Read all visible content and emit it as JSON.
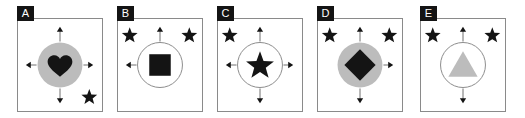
{
  "figure": {
    "type": "panel-series",
    "panel_count": 5,
    "background_color": "#ffffff",
    "frame_color": "#8a8a8a",
    "badge_background": "#141414",
    "badge_text_color": "#ffffff",
    "gray_fill": "#bcbcbc",
    "black_fill": "#141414",
    "arrow_color": "#6e6e6e"
  },
  "panels": [
    {
      "label": "A",
      "circle": {
        "fill": "gray",
        "outline": "none"
      },
      "shape": {
        "name": "heart",
        "fill": "black"
      },
      "arrows": [
        "up",
        "right",
        "down",
        "left"
      ],
      "arrow_count": 4,
      "stars": [
        "bottom-right"
      ],
      "star_count": 1
    },
    {
      "label": "B",
      "circle": {
        "fill": "white",
        "outline": "gray"
      },
      "shape": {
        "name": "square",
        "fill": "black"
      },
      "arrows": [
        "up",
        "left"
      ],
      "arrow_count": 2,
      "stars": [
        "top-left",
        "top-right"
      ],
      "star_count": 2
    },
    {
      "label": "C",
      "circle": {
        "fill": "white",
        "outline": "gray"
      },
      "shape": {
        "name": "star",
        "fill": "black"
      },
      "arrows": [
        "up",
        "right",
        "down",
        "left"
      ],
      "arrow_count": 4,
      "stars": [
        "top-left"
      ],
      "star_count": 1
    },
    {
      "label": "D",
      "circle": {
        "fill": "gray",
        "outline": "none"
      },
      "shape": {
        "name": "diamond",
        "fill": "black"
      },
      "arrows": [
        "up",
        "right",
        "down"
      ],
      "arrow_count": 3,
      "stars": [
        "top-left",
        "top-right"
      ],
      "star_count": 2
    },
    {
      "label": "E",
      "circle": {
        "fill": "white",
        "outline": "gray"
      },
      "shape": {
        "name": "triangle",
        "fill": "gray"
      },
      "arrows": [
        "up",
        "down"
      ],
      "arrow_count": 2,
      "stars": [
        "top-left",
        "top-right"
      ],
      "star_count": 2
    }
  ]
}
